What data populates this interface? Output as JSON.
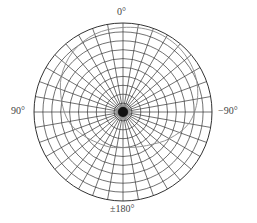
{
  "chart_data": {
    "type": "polar",
    "title": "",
    "angle_labels": [
      {
        "angle_deg": 0,
        "text": "0°",
        "position": "top"
      },
      {
        "angle_deg": 90,
        "text": "90°",
        "position": "left"
      },
      {
        "angle_deg": -90,
        "text": "−90°",
        "position": "right"
      },
      {
        "angle_deg": 180,
        "text": "±180°",
        "position": "bottom"
      }
    ],
    "grid": {
      "radial_spokes": 36,
      "spoke_step_deg": 10,
      "rings": 10,
      "rlim": [
        0,
        1
      ]
    },
    "series": [
      {
        "name": "pattern",
        "angles_deg": [
          0,
          20,
          40,
          60,
          80,
          100,
          120,
          140,
          160,
          180,
          -160,
          -140,
          -120,
          -100,
          -80,
          -60,
          -40,
          -20
        ],
        "r": [
          0.95,
          0.93,
          0.88,
          0.8,
          0.7,
          0.62,
          0.52,
          0.45,
          0.42,
          0.4,
          0.42,
          0.48,
          0.6,
          0.75,
          0.85,
          0.92,
          0.96,
          0.97
        ]
      }
    ],
    "colors": {
      "grid": "#333333",
      "pattern": "#888888",
      "label": "#444444"
    }
  }
}
